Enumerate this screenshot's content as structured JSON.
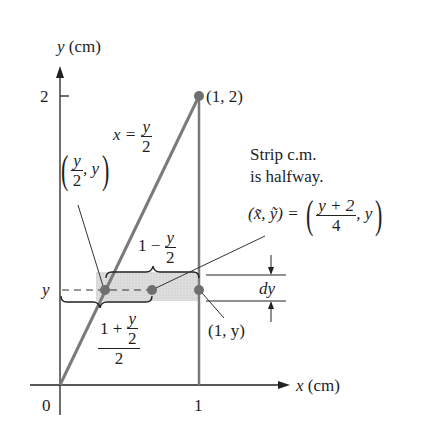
{
  "axes": {
    "y_label": "y (cm)",
    "x_label": "x (cm)",
    "origin": "0",
    "x_tick": "1",
    "y_tick": "2",
    "y_strip_label": "y"
  },
  "curve": {
    "equation_lhs": "x =",
    "equation_num": "y",
    "equation_den": "2"
  },
  "points": {
    "top": "(1, 2)",
    "right": "(1, y)",
    "left_num": "y",
    "left_den": "2",
    "left_tail": ", y"
  },
  "annotation": {
    "line1": "Strip c.m.",
    "line2": "is halfway.",
    "cm_lhs": "(x̃, ỹ) =",
    "cm_num": "y + 2",
    "cm_den": "4",
    "cm_tail": ", y"
  },
  "strip": {
    "length_prefix": "1 −",
    "length_num": "y",
    "length_den": "2",
    "half_top": "1 +",
    "half_num": "y",
    "half_den": "2",
    "half_outer_den": "2",
    "thickness": "dy"
  },
  "colors": {
    "line": "#7a7a7a",
    "axis": "#222222",
    "strip_fill": "#d9d9d9",
    "dot": "#6f6f6f"
  }
}
